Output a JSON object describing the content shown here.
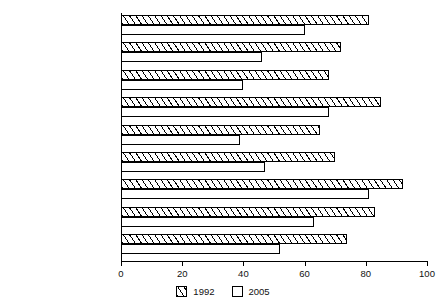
{
  "chart_data": {
    "type": "bar",
    "orientation": "horizontal",
    "title": "",
    "xlabel": "",
    "ylabel": "",
    "xlim": [
      0,
      100
    ],
    "xticks": [
      0,
      20,
      40,
      60,
      80,
      100
    ],
    "grid": false,
    "legend_position": "bottom-center",
    "categories": [
      "Belgium-Luxembourg",
      "Denmark",
      "France",
      "Germany, Fed. Rep.",
      "Ireland",
      "Italy",
      "The Netherlands",
      "United Kingdom",
      "EU-9"
    ],
    "series": [
      {
        "name": "1992",
        "fill": "hatched",
        "values": [
          81,
          72,
          68,
          85,
          65,
          70,
          92,
          83,
          74
        ]
      },
      {
        "name": "2005",
        "fill": "white",
        "values": [
          60,
          46,
          40,
          68,
          39,
          47,
          81,
          63,
          52
        ]
      }
    ]
  },
  "legend": {
    "entries": [
      {
        "label": "1992"
      },
      {
        "label": "2005"
      }
    ]
  },
  "colors": {
    "axis": "#000000",
    "bar_outline": "#000000",
    "bar_fill_1992": "#ffffff",
    "bar_fill_2005": "#ffffff",
    "text": "#111111",
    "background": "#ffffff"
  }
}
